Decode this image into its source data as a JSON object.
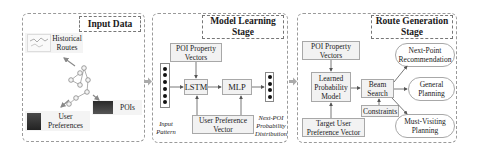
{
  "input_panel": {
    "title": "Input Data",
    "historical_routes": [
      "Historical",
      "Routes"
    ],
    "user_preferences": [
      "User",
      "Preferences"
    ],
    "pois": "POIs"
  },
  "model_panel": {
    "title": [
      "Model Learning",
      "Stage"
    ],
    "poi_property_vectors": [
      "POI Property",
      "Vectors"
    ],
    "lstm": "LSTM",
    "mlp": "MLP",
    "user_preference_vector": [
      "User Preference",
      "Vector"
    ],
    "input_pattern": [
      "Input",
      "Pattern"
    ],
    "next_poi_distribution": [
      "Next-POI",
      "Probability",
      "Distribution"
    ]
  },
  "route_panel": {
    "title": [
      "Route Generation",
      "Stage"
    ],
    "poi_property_vectors": [
      "POI Property",
      "Vectors"
    ],
    "learned_model": [
      "Learned",
      "Probability",
      "Model"
    ],
    "beam_search": [
      "Beam",
      "Search"
    ],
    "constraints": "Constraints",
    "target_user_vector": [
      "Target User",
      "Preference Vector"
    ],
    "outputs": [
      [
        "Next-Point",
        "Recommendation"
      ],
      [
        "General",
        "Planning"
      ],
      [
        "Must-Visiting",
        "Planning"
      ]
    ]
  }
}
